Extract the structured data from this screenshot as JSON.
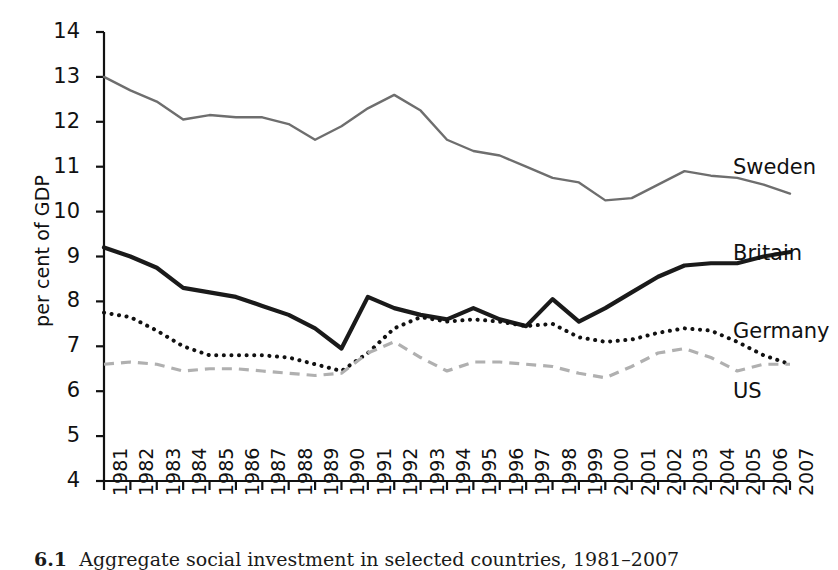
{
  "figure": {
    "caption_number": "6.1",
    "caption_text": "Aggregate social investment in selected countries, 1981–2007"
  },
  "axes": {
    "ylabel": "per cent of GDP",
    "yticks": [
      "4",
      "5",
      "6",
      "7",
      "8",
      "9",
      "10",
      "11",
      "12",
      "13",
      "14"
    ],
    "xticks": [
      "1981",
      "1982",
      "1983",
      "1984",
      "1985",
      "1986",
      "1987",
      "1988",
      "1989",
      "1990",
      "1991",
      "1992",
      "1993",
      "1994",
      "1995",
      "1996",
      "1997",
      "1998",
      "1999",
      "2000",
      "2001",
      "2002",
      "2003",
      "2004",
      "2005",
      "2006",
      "2007"
    ]
  },
  "labels": {
    "sweden": "Sweden",
    "britain": "Britain",
    "germany": "Germany",
    "us": "US"
  },
  "colors": {
    "sweden": "#6e6e6e",
    "britain": "#1a1a1a",
    "germany": "#111111",
    "us": "#b0b0b0",
    "axis": "#111111"
  },
  "chart_data": {
    "type": "line",
    "title": "Aggregate social investment in selected countries, 1981–2007",
    "xlabel": "",
    "ylabel": "per cent of GDP",
    "ylim": [
      4,
      14
    ],
    "grid": false,
    "legend_position": "inline-right",
    "categories": [
      "1981",
      "1982",
      "1983",
      "1984",
      "1985",
      "1986",
      "1987",
      "1988",
      "1989",
      "1990",
      "1991",
      "1992",
      "1993",
      "1994",
      "1995",
      "1996",
      "1997",
      "1998",
      "1999",
      "2000",
      "2001",
      "2002",
      "2003",
      "2004",
      "2005",
      "2006",
      "2007"
    ],
    "series": [
      {
        "name": "Sweden",
        "style": "solid-thin-gray",
        "color": "#6e6e6e",
        "values": [
          13.0,
          12.7,
          12.45,
          12.05,
          12.15,
          12.1,
          12.1,
          11.95,
          11.6,
          11.9,
          12.3,
          12.6,
          12.25,
          11.6,
          11.35,
          11.25,
          11.0,
          10.75,
          10.65,
          10.25,
          10.3,
          10.6,
          10.9,
          10.8,
          10.75,
          10.6,
          10.4
        ]
      },
      {
        "name": "Britain",
        "style": "solid-thick-black",
        "color": "#1a1a1a",
        "values": [
          9.2,
          9.0,
          8.75,
          8.3,
          8.2,
          8.1,
          7.9,
          7.7,
          7.4,
          6.95,
          8.1,
          7.85,
          7.7,
          7.6,
          7.85,
          7.6,
          7.45,
          8.05,
          7.55,
          7.85,
          8.2,
          8.55,
          8.8,
          8.85,
          8.85,
          9.0,
          9.1
        ]
      },
      {
        "name": "Germany",
        "style": "dotted-black",
        "color": "#111111",
        "values": [
          7.75,
          7.65,
          7.35,
          7.0,
          6.8,
          6.8,
          6.8,
          6.75,
          6.6,
          6.45,
          6.85,
          7.4,
          7.65,
          7.55,
          7.6,
          7.55,
          7.45,
          7.5,
          7.2,
          7.1,
          7.15,
          7.3,
          7.4,
          7.35,
          7.1,
          6.8,
          6.6
        ]
      },
      {
        "name": "US",
        "style": "dashed-lightgray",
        "color": "#b0b0b0",
        "values": [
          6.6,
          6.65,
          6.6,
          6.45,
          6.5,
          6.5,
          6.45,
          6.4,
          6.35,
          6.4,
          6.85,
          7.1,
          6.75,
          6.45,
          6.65,
          6.65,
          6.6,
          6.55,
          6.4,
          6.3,
          6.55,
          6.85,
          6.95,
          6.75,
          6.45,
          6.6,
          6.6
        ]
      }
    ]
  }
}
